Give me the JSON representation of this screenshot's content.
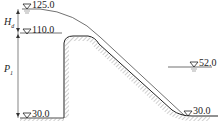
{
  "diagram": {
    "type": "spillway-weir-profile",
    "elevations": {
      "headwater": "125.0",
      "crest": "110.0",
      "tailwater": "52.0",
      "upstream_bed": "30.0",
      "downstream_bed": "30.0"
    },
    "dimensions": {
      "head": "H",
      "head_sub": "d",
      "weir_height": "P",
      "weir_height_sub": "1"
    }
  }
}
